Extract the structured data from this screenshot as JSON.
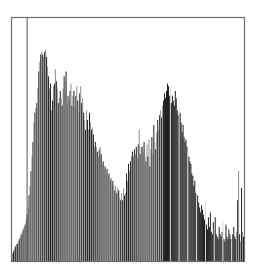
{
  "chart_data": {
    "type": "bar",
    "title": "",
    "xlabel": "",
    "ylabel": "",
    "x_range": [
      0,
      255
    ],
    "ylim": [
      0,
      100
    ],
    "grid": false,
    "legend": "none",
    "marker_value": 16,
    "bar_colors": [
      "#8c8c8c",
      "#1a1a1a"
    ],
    "frame_color": "#6e6e6e",
    "values": [
      3,
      4,
      5,
      6,
      7,
      7,
      8,
      9,
      10,
      11,
      12,
      13,
      14,
      15,
      17,
      19,
      22,
      27,
      31,
      37,
      43,
      49,
      57,
      61,
      63,
      65,
      71,
      78,
      82,
      85,
      86,
      85,
      84,
      86,
      87,
      84,
      80,
      76,
      71,
      73,
      62,
      66,
      72,
      73,
      79,
      74,
      71,
      65,
      67,
      70,
      67,
      64,
      71,
      76,
      74,
      78,
      65,
      68,
      66,
      70,
      73,
      64,
      68,
      70,
      63,
      68,
      72,
      66,
      61,
      69,
      72,
      65,
      67,
      61,
      58,
      54,
      62,
      58,
      54,
      61,
      57,
      54,
      55,
      52,
      47,
      49,
      47,
      45,
      43,
      46,
      47,
      44,
      40,
      41,
      38,
      39,
      36,
      38,
      35,
      36,
      33,
      34,
      31,
      33,
      31,
      29,
      31,
      28,
      30,
      29,
      26,
      25,
      28,
      25,
      30,
      27,
      28,
      36,
      33,
      40,
      37,
      41,
      43,
      45,
      43,
      46,
      44,
      47,
      42,
      48,
      54,
      44,
      47,
      47,
      45,
      49,
      43,
      41,
      48,
      43,
      50,
      39,
      46,
      51,
      44,
      56,
      49,
      46,
      53,
      58,
      54,
      60,
      62,
      59,
      64,
      66,
      69,
      67,
      70,
      73,
      72,
      68,
      71,
      65,
      68,
      66,
      64,
      70,
      67,
      62,
      60,
      63,
      61,
      57,
      53,
      56,
      51,
      49,
      50,
      47,
      45,
      43,
      41,
      40,
      36,
      35,
      31,
      33,
      28,
      26,
      27,
      24,
      22,
      20,
      23,
      21,
      19,
      17,
      25,
      15,
      13,
      18,
      14,
      20,
      12,
      11,
      16,
      13,
      18,
      11,
      10,
      9,
      14,
      11,
      10,
      12,
      16,
      9,
      8,
      15,
      10,
      9,
      13,
      11,
      9,
      8,
      11,
      14,
      10,
      9,
      12,
      25,
      37,
      11,
      8,
      30,
      12,
      10
    ]
  }
}
